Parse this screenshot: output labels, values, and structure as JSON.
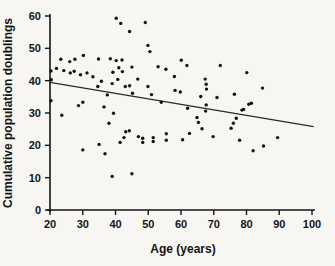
{
  "figure": {
    "background": "#f7f6f3",
    "ink": "#141414",
    "point_color": "#111111",
    "trend_color": "#2a2a2a"
  },
  "chart_data": {
    "type": "scatter",
    "title": "",
    "xlabel": "Age (years)",
    "ylabel": "Cumulative population doublings",
    "xlim": [
      20,
      100
    ],
    "ylim": [
      0,
      60
    ],
    "x_ticks": [
      20,
      30,
      40,
      50,
      60,
      70,
      80,
      90,
      100
    ],
    "y_ticks": [
      0,
      10,
      20,
      30,
      40,
      50,
      60
    ],
    "grid": false,
    "legend_position": "none",
    "marker": "dot",
    "points": [
      [
        20.3,
        43.0
      ],
      [
        20.4,
        40.3
      ],
      [
        20.3,
        33.8
      ],
      [
        22.0,
        43.8
      ],
      [
        23.3,
        46.6
      ],
      [
        24.2,
        43.1
      ],
      [
        23.6,
        29.3
      ],
      [
        26.0,
        45.9
      ],
      [
        27.6,
        46.6
      ],
      [
        26.2,
        42.4
      ],
      [
        27.4,
        42.9
      ],
      [
        29.3,
        41.8
      ],
      [
        30.2,
        47.8
      ],
      [
        28.7,
        32.3
      ],
      [
        30.0,
        33.3
      ],
      [
        30.0,
        18.6
      ],
      [
        31.3,
        42.4
      ],
      [
        33.1,
        41.2
      ],
      [
        34.8,
        46.7
      ],
      [
        35.7,
        39.8
      ],
      [
        34.6,
        38.2
      ],
      [
        35.0,
        20.3
      ],
      [
        36.8,
        17.4
      ],
      [
        37.5,
        35.6
      ],
      [
        36.5,
        31.9
      ],
      [
        38.4,
        46.8
      ],
      [
        39.2,
        42.6
      ],
      [
        39.0,
        39.1
      ],
      [
        39.4,
        29.9
      ],
      [
        38.0,
        26.8
      ],
      [
        39.0,
        10.4
      ],
      [
        40.2,
        59.3
      ],
      [
        41.6,
        57.7
      ],
      [
        40.2,
        46.2
      ],
      [
        42.0,
        46.4
      ],
      [
        41.0,
        44.0
      ],
      [
        42.1,
        42.8
      ],
      [
        40.7,
        40.4
      ],
      [
        43.0,
        38.2
      ],
      [
        44.3,
        55.2
      ],
      [
        45.0,
        44.2
      ],
      [
        44.3,
        38.4
      ],
      [
        45.2,
        36.1
      ],
      [
        46.8,
        40.5
      ],
      [
        43.1,
        24.2
      ],
      [
        44.2,
        24.5
      ],
      [
        41.4,
        20.9
      ],
      [
        42.6,
        22.4
      ],
      [
        45.0,
        11.2
      ],
      [
        47.0,
        22.7
      ],
      [
        48.3,
        22.2
      ],
      [
        48.3,
        20.9
      ],
      [
        49.1,
        58.0
      ],
      [
        49.9,
        50.9
      ],
      [
        50.5,
        49.0
      ],
      [
        49.9,
        38.2
      ],
      [
        51.0,
        35.7
      ],
      [
        51.5,
        22.4
      ],
      [
        51.5,
        21.2
      ],
      [
        53.0,
        44.3
      ],
      [
        55.4,
        43.5
      ],
      [
        54.0,
        33.3
      ],
      [
        55.5,
        23.6
      ],
      [
        55.5,
        21.6
      ],
      [
        58.0,
        41.3
      ],
      [
        58.2,
        37.0
      ],
      [
        59.8,
        36.5
      ],
      [
        60.1,
        46.3
      ],
      [
        61.8,
        44.7
      ],
      [
        62.0,
        31.5
      ],
      [
        60.5,
        21.7
      ],
      [
        62.6,
        23.7
      ],
      [
        64.9,
        28.6
      ],
      [
        65.3,
        27.1
      ],
      [
        66.4,
        25.1
      ],
      [
        67.4,
        40.5
      ],
      [
        67.7,
        38.9
      ],
      [
        67.8,
        37.4
      ],
      [
        66.0,
        35.1
      ],
      [
        67.7,
        32.5
      ],
      [
        67.5,
        30.6
      ],
      [
        69.8,
        22.7
      ],
      [
        71.0,
        34.8
      ],
      [
        72.0,
        44.7
      ],
      [
        75.3,
        25.3
      ],
      [
        76.0,
        26.8
      ],
      [
        76.9,
        28.4
      ],
      [
        76.3,
        35.8
      ],
      [
        78.6,
        30.9
      ],
      [
        77.9,
        21.6
      ],
      [
        79.1,
        31.1
      ],
      [
        80.1,
        42.5
      ],
      [
        80.7,
        32.7
      ],
      [
        81.5,
        33.0
      ],
      [
        82.0,
        18.3
      ],
      [
        84.9,
        37.7
      ],
      [
        85.2,
        19.8
      ],
      [
        89.5,
        22.4
      ]
    ],
    "trend_line": {
      "x1": 20.0,
      "y1": 39.5,
      "x2": 100.5,
      "y2": 25.8
    }
  }
}
